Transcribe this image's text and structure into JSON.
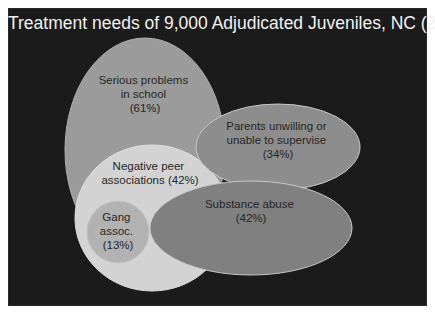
{
  "title": "Treatment needs of 9,000 Adjudicated Juveniles, NC (2008)",
  "colors": {
    "background": "#1b1b1b",
    "title_text": "#f2f2f2",
    "label_text": "#262626",
    "serious_problems": "#9b9b9b",
    "negative_peer": "#d3d3d3",
    "gang_assoc": "#b2b2b2",
    "parents": "#8d8d8d",
    "substance_abuse": "#808080",
    "outline": "#c8c8c8"
  },
  "sets": [
    {
      "id": "serious_problems",
      "lines": [
        "Serious problems",
        "in school",
        "(61%)"
      ],
      "name": "Serious problems in school",
      "percent": 61
    },
    {
      "id": "negative_peer",
      "lines": [
        "Negative peer",
        "associations (42%)"
      ],
      "name": "Negative peer associations",
      "percent": 42
    },
    {
      "id": "gang_assoc",
      "lines": [
        "Gang",
        "assoc.",
        "(13%)"
      ],
      "name": "Gang assoc.",
      "percent": 13
    },
    {
      "id": "parents",
      "lines": [
        "Parents unwilling or",
        "unable to supervise",
        "(34%)"
      ],
      "name": "Parents unwilling or unable to supervise",
      "percent": 34
    },
    {
      "id": "substance_abuse",
      "lines": [
        "Substance abuse",
        "(42%)"
      ],
      "name": "Substance abuse",
      "percent": 42
    }
  ]
}
